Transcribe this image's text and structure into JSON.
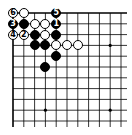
{
  "diagram": {
    "type": "go-board-partial",
    "corner": "top-left",
    "grid": {
      "origin_x": 13,
      "origin_y": 13,
      "spacing": 10.8,
      "cols": 11,
      "rows": 11
    },
    "star_points": [
      [
        3,
        3
      ],
      [
        9,
        3
      ],
      [
        3,
        9
      ],
      [
        9,
        9
      ]
    ],
    "colors": {
      "line": "#000000",
      "black_stone": "#000000",
      "white_stone": "#ffffff",
      "background": "#ffffff"
    },
    "stones": [
      {
        "col": 0,
        "row": 0,
        "color": "white",
        "label": "6"
      },
      {
        "col": 1,
        "row": 0,
        "color": "white",
        "label": ""
      },
      {
        "col": 4,
        "row": 0,
        "color": "black",
        "label": "5"
      },
      {
        "col": 0,
        "row": 1,
        "color": "black",
        "label": "3"
      },
      {
        "col": 1,
        "row": 1,
        "color": "black",
        "label": ""
      },
      {
        "col": 2,
        "row": 1,
        "color": "white",
        "label": ""
      },
      {
        "col": 3,
        "row": 1,
        "color": "white",
        "label": ""
      },
      {
        "col": 4,
        "row": 1,
        "color": "black",
        "label": "1"
      },
      {
        "col": 0,
        "row": 2,
        "color": "white",
        "label": "4"
      },
      {
        "col": 1,
        "row": 2,
        "color": "white",
        "label": "2"
      },
      {
        "col": 2,
        "row": 2,
        "color": "black",
        "label": ""
      },
      {
        "col": 3,
        "row": 2,
        "color": "white",
        "label": ""
      },
      {
        "col": 4,
        "row": 2,
        "color": "black",
        "label": ""
      },
      {
        "col": 2,
        "row": 3,
        "color": "black",
        "label": ""
      },
      {
        "col": 3,
        "row": 3,
        "color": "black",
        "label": ""
      },
      {
        "col": 4,
        "row": 3,
        "color": "white",
        "label": ""
      },
      {
        "col": 5,
        "row": 3,
        "color": "white",
        "label": ""
      },
      {
        "col": 6,
        "row": 3,
        "color": "white",
        "label": ""
      },
      {
        "col": 4,
        "row": 4,
        "color": "black",
        "label": ""
      },
      {
        "col": 3,
        "row": 5,
        "color": "black",
        "label": ""
      }
    ]
  }
}
